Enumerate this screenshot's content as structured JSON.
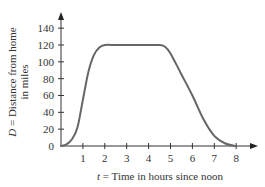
{
  "chart_data": {
    "type": "line",
    "title": "",
    "xlabel_var": "t",
    "xlabel_text": " = Time in hours since noon",
    "ylabel_var": "D",
    "ylabel_line1": " = Distance from home",
    "ylabel_line2": "in miles",
    "x_ticks": [
      1,
      2,
      3,
      4,
      5,
      6,
      7,
      8
    ],
    "y_ticks": [
      0,
      20,
      40,
      60,
      80,
      100,
      120,
      140
    ],
    "xlim": [
      0,
      8.5
    ],
    "ylim": [
      0,
      155
    ],
    "grid": false,
    "legend": null,
    "series": [
      {
        "name": "D(t)",
        "color": "#666666",
        "points": [
          [
            0,
            0
          ],
          [
            0.25,
            2
          ],
          [
            0.5,
            8
          ],
          [
            0.75,
            22
          ],
          [
            1.0,
            55
          ],
          [
            1.25,
            88
          ],
          [
            1.5,
            108
          ],
          [
            1.75,
            117
          ],
          [
            2.0,
            120
          ],
          [
            2.5,
            120
          ],
          [
            3.0,
            120
          ],
          [
            3.5,
            120
          ],
          [
            4.0,
            120
          ],
          [
            4.5,
            120
          ],
          [
            4.75,
            118
          ],
          [
            5.0,
            110
          ],
          [
            5.5,
            85
          ],
          [
            6.0,
            60
          ],
          [
            6.5,
            32
          ],
          [
            7.0,
            12
          ],
          [
            7.5,
            3
          ],
          [
            8.0,
            0
          ]
        ]
      }
    ]
  },
  "labels": {
    "origin": "0"
  }
}
